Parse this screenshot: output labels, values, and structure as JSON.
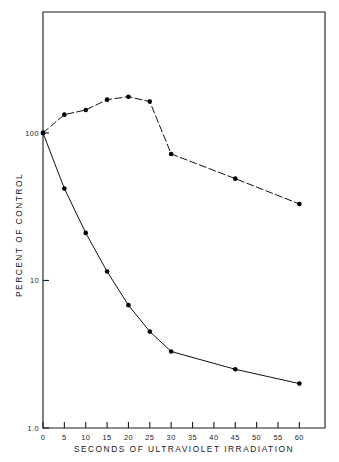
{
  "chart_data": {
    "type": "line",
    "title": "",
    "subtitle": "",
    "xlabel": "SECONDS OF ULTRAVIOLET IRRADIATION",
    "ylabel": "PERCENT OF CONTROL",
    "x_ticks": [
      0,
      5,
      10,
      15,
      20,
      25,
      30,
      35,
      40,
      45,
      50,
      55,
      60
    ],
    "x_tick_labels": [
      "0",
      "5",
      "10",
      "15",
      "20",
      "25",
      "30",
      "35",
      "40",
      "45",
      "50",
      "55",
      "60"
    ],
    "xlim": [
      0,
      66
    ],
    "y_scale": "log",
    "y_ticks": [
      1.0,
      10,
      100
    ],
    "y_tick_labels": [
      "1.0",
      "10",
      "100"
    ],
    "ylim": [
      1.0,
      660
    ],
    "grid": false,
    "legend": "none",
    "series": [
      {
        "name": "upper-curve",
        "linestyle": "dashed",
        "marker": "filled-circle",
        "color": "#111111",
        "x": [
          0,
          5,
          10,
          15,
          20,
          25,
          30,
          45,
          60
        ],
        "values": [
          100,
          133,
          143,
          168,
          176,
          163,
          72,
          49,
          33
        ]
      },
      {
        "name": "lower-curve",
        "linestyle": "solid",
        "marker": "filled-circle",
        "color": "#111111",
        "x": [
          0,
          5,
          10,
          15,
          20,
          25,
          30,
          45,
          60
        ],
        "values": [
          100,
          42,
          21,
          11.5,
          6.8,
          4.5,
          3.3,
          2.5,
          2.0
        ]
      }
    ]
  },
  "axes": {
    "x_title": "SECONDS OF ULTRAVIOLET IRRADIATION",
    "y_title": "PERCENT OF CONTROL"
  }
}
